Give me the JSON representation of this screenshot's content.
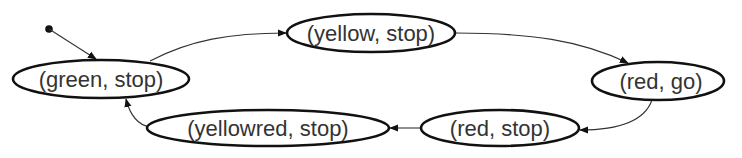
{
  "diagram": {
    "type": "state-machine",
    "initial_state": "green-stop",
    "nodes": [
      {
        "id": "green-stop",
        "label": "(green, stop)",
        "cx": 101,
        "cy": 79,
        "rx": 88,
        "ry": 19
      },
      {
        "id": "yellow-stop",
        "label": "(yellow, stop)",
        "cx": 371,
        "cy": 33,
        "rx": 84,
        "ry": 19
      },
      {
        "id": "red-go",
        "label": "(red, go)",
        "cx": 658,
        "cy": 81,
        "rx": 66,
        "ry": 19
      },
      {
        "id": "red-stop",
        "label": "(red, stop)",
        "cx": 500,
        "cy": 128,
        "rx": 79,
        "ry": 18
      },
      {
        "id": "yellowred-stop",
        "label": "(yellowred, stop)",
        "cx": 268,
        "cy": 128,
        "rx": 121,
        "ry": 18
      }
    ],
    "edges": [
      {
        "from": "initial",
        "to": "green-stop"
      },
      {
        "from": "green-stop",
        "to": "yellow-stop"
      },
      {
        "from": "yellow-stop",
        "to": "red-go"
      },
      {
        "from": "red-go",
        "to": "red-stop"
      },
      {
        "from": "red-stop",
        "to": "yellowred-stop"
      },
      {
        "from": "yellowred-stop",
        "to": "green-stop"
      }
    ]
  }
}
